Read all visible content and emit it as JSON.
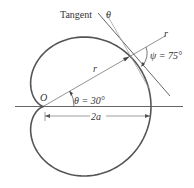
{
  "diagram": {
    "type": "cardioid-tangent",
    "labels": {
      "tangent": "Tangent",
      "theta_top": "θ",
      "r_ray": "r",
      "psi": "ψ = 75°",
      "r_segment": "r",
      "origin": "O",
      "theta_angle": "θ = 30°",
      "diameter": "2a"
    },
    "colors": {
      "curve": "#555555",
      "lines": "#666666",
      "text": "#333333",
      "background": "#ffffff"
    }
  }
}
